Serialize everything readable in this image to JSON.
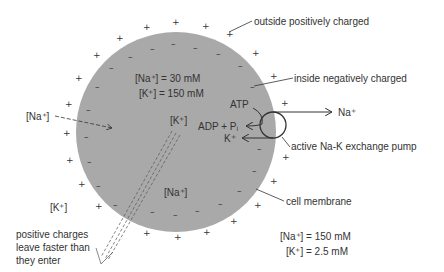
{
  "labels": {
    "outside": "outside positively charged",
    "inside": "inside negatively charged",
    "na_in_conc": "[Na⁺] = 30 mM",
    "k_in_conc": "[K⁺] = 150 mM",
    "na_out": "[Na⁺]",
    "k_inside": "[K⁺]",
    "atp": "ATP",
    "adp": "ADP + Pᵢ",
    "na_ion": "Na⁺",
    "k_ion": "K⁺",
    "pump": "active Na-K exchange pump",
    "na_inside": "[Na⁺]",
    "k_out": "[K⁺]",
    "membrane": "cell membrane",
    "na_out_conc": "[Na⁺] = 150 mM",
    "k_out_conc": "[K⁺] = 2.5 mM",
    "leak_line1": "positive charges",
    "leak_line2": "leave faster than",
    "leak_line3": "they enter"
  },
  "signs": {
    "plus": "+",
    "minus": "–"
  },
  "colors": {
    "cell_fill": "#a9a9a9",
    "ink": "#333333"
  }
}
